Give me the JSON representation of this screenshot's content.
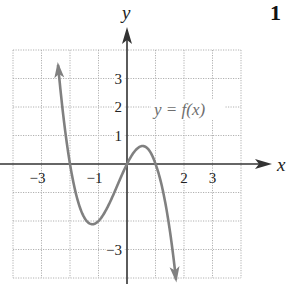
{
  "problem_number": "1",
  "chart_data": {
    "type": "line",
    "title": "",
    "xlabel": "x",
    "ylabel": "y",
    "curve_label": "y = f(x)",
    "xlim": [
      -4,
      4
    ],
    "ylim": [
      -4,
      4
    ],
    "grid": true,
    "x_tick_labels": [
      {
        "value": -3,
        "label": "−3"
      },
      {
        "value": -1,
        "label": "−1"
      },
      {
        "value": 2,
        "label": "2"
      },
      {
        "value": 3,
        "label": "3"
      }
    ],
    "y_tick_labels": [
      {
        "value": 3,
        "label": "3"
      },
      {
        "value": 2,
        "label": "2"
      },
      {
        "value": 1,
        "label": "1"
      },
      {
        "value": -3,
        "label": "−3"
      }
    ],
    "series": [
      {
        "name": "f(x)",
        "formula": "-x^3 - x^2 + 2x",
        "x_range": [
          -2.42,
          1.72
        ],
        "key_points": [
          {
            "x": -2.4,
            "y": 4.0,
            "note": "arrow (continues up)"
          },
          {
            "x": -2.0,
            "y": 0.0,
            "note": "x-intercept"
          },
          {
            "x": -1.2,
            "y": -2.1,
            "note": "local minimum"
          },
          {
            "x": 0.0,
            "y": 0.0,
            "note": "x-intercept"
          },
          {
            "x": 0.55,
            "y": 0.6,
            "note": "local maximum"
          },
          {
            "x": 1.0,
            "y": 0.0,
            "note": "x-intercept"
          },
          {
            "x": 1.7,
            "y": -3.9,
            "note": "arrow (continues down)"
          }
        ]
      }
    ]
  },
  "colors": {
    "axis": "#333333",
    "curve": "#808080",
    "grid": "#b0b0b0",
    "text": "#222222",
    "curve_label": "#6e6e6e"
  }
}
